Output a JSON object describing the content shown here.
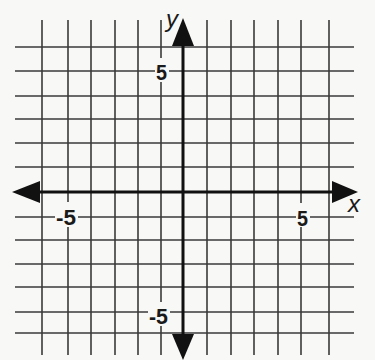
{
  "diagram": {
    "type": "coordinate-grid",
    "x_axis_label": "x",
    "y_axis_label": "y",
    "grid_range": {
      "x": [
        -6,
        6
      ],
      "y": [
        -6,
        6
      ]
    },
    "tick_labels": {
      "x_negative": "-5",
      "x_positive": "5",
      "y_positive": "5",
      "y_negative": "-5"
    },
    "origin_px": [
      183,
      192
    ],
    "vertical_lines_px": [
      42,
      68,
      91,
      115,
      138,
      161,
      183,
      207,
      231,
      254,
      278,
      301,
      329
    ],
    "horizontal_lines_px": [
      47,
      71,
      96,
      119,
      143,
      167,
      192,
      217,
      240,
      264,
      287,
      312,
      333
    ],
    "colors": {
      "grid": "#3a3a3a",
      "axis": "#111111",
      "background": "#f8f8f6"
    }
  }
}
